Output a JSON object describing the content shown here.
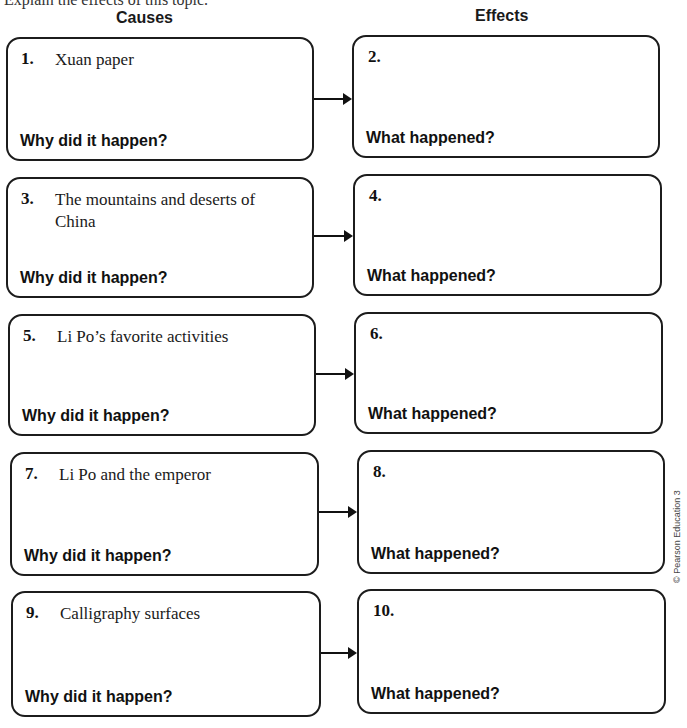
{
  "page": {
    "top_cutoff_text": "Explain the effects of this topic.",
    "headers": {
      "causes": "Causes",
      "effects": "Effects"
    },
    "rows": [
      {
        "cause": {
          "number": "1.",
          "text": "Xuan paper",
          "question": "Why did it happen?"
        },
        "effect": {
          "number": "2.",
          "text": "",
          "question": "What happened?"
        }
      },
      {
        "cause": {
          "number": "3.",
          "text": "The mountains and deserts of China",
          "question": "Why did it happen?"
        },
        "effect": {
          "number": "4.",
          "text": "",
          "question": "What happened?"
        }
      },
      {
        "cause": {
          "number": "5.",
          "text": "Li Po’s favorite activities",
          "question": "Why did it happen?"
        },
        "effect": {
          "number": "6.",
          "text": "",
          "question": "What happened?"
        }
      },
      {
        "cause": {
          "number": "7.",
          "text": "Li Po and the emperor",
          "question": "Why did it happen?"
        },
        "effect": {
          "number": "8.",
          "text": "",
          "question": "What happened?"
        }
      },
      {
        "cause": {
          "number": "9.",
          "text": "Calligraphy surfaces",
          "question": "Why did it happen?"
        },
        "effect": {
          "number": "10.",
          "text": "",
          "question": "What happened?"
        }
      }
    ],
    "copyright": "© Pearson Education 3",
    "colors": {
      "border": "#1c1c1c",
      "text": "#111111",
      "background": "#ffffff"
    }
  }
}
